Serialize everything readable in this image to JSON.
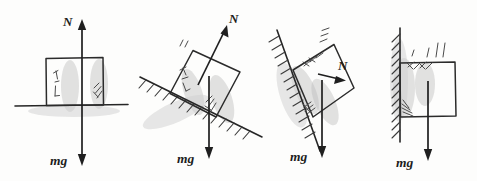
{
  "figure": {
    "background_color": "#fdfdfc",
    "ink_color": "#262626",
    "panels": [
      {
        "id": "panel-horizontal-surface",
        "surface": "horizontal ground",
        "normal_label": "N",
        "weight_label": "mg",
        "normal_direction": "up",
        "weight_direction": "down"
      },
      {
        "id": "panel-inclined-surface",
        "surface": "inclined plane descending to the right",
        "normal_label": "N",
        "weight_label": "mg",
        "normal_direction": "up-right, perpendicular to incline",
        "weight_direction": "down"
      },
      {
        "id": "panel-steep-incline",
        "surface": "steep incline descending to the right",
        "normal_label": "N",
        "weight_label": "mg",
        "normal_direction": "right, perpendicular to steep incline",
        "weight_direction": "down"
      },
      {
        "id": "panel-vertical-wall",
        "surface": "vertical wall on the left",
        "normal_label": "",
        "weight_label": "mg",
        "normal_direction": "horizontal (not drawn)",
        "weight_direction": "down"
      }
    ]
  },
  "labels": {
    "n1": "N",
    "mg1": "mg",
    "n2": "N",
    "mg2": "mg",
    "n3": "N",
    "mg3": "mg",
    "mg4": "mg"
  }
}
